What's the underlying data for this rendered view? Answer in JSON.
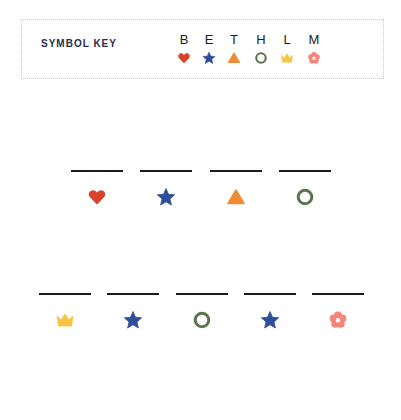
{
  "key": {
    "title": "SYMBOL KEY",
    "entries": [
      {
        "letter": "B",
        "icon": "heart-icon",
        "color": "#d9432b"
      },
      {
        "letter": "E",
        "icon": "star-icon",
        "color": "#2f4f9a"
      },
      {
        "letter": "T",
        "icon": "triangle-icon",
        "color": "#ef8a35"
      },
      {
        "letter": "H",
        "icon": "circle-icon",
        "color": "#5b7350"
      },
      {
        "letter": "L",
        "icon": "crown-icon",
        "color": "#f5c542"
      },
      {
        "letter": "M",
        "icon": "flower-icon",
        "color": "#f4857a"
      }
    ]
  },
  "puzzle": {
    "word1": {
      "blanks": [
        "",
        "",
        "",
        ""
      ],
      "symbols": [
        "heart-icon",
        "star-icon",
        "triangle-icon",
        "circle-icon"
      ]
    },
    "word2": {
      "blanks": [
        "",
        "",
        "",
        "",
        ""
      ],
      "symbols": [
        "crown-icon",
        "star-icon",
        "circle-icon",
        "star-icon",
        "flower-icon"
      ]
    }
  },
  "colors": {
    "heart": "#d9432b",
    "star": "#2f4f9a",
    "triangle": "#ef8a35",
    "circle": "#5b7350",
    "crown": "#f5c542",
    "flower": "#f4857a",
    "key_border": "#eab8bd",
    "title_text": "#2a2f45"
  }
}
